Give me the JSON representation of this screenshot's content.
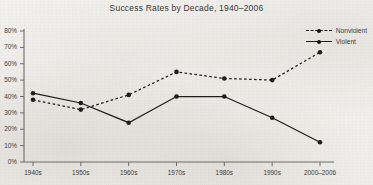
{
  "chart_data": {
    "type": "line",
    "title": "Success Rates by Decade, 1940–2006",
    "xlabel": "",
    "ylabel": "",
    "categories": [
      "1940s",
      "1950s",
      "1960s",
      "1970s",
      "1980s",
      "1990s",
      "2000–2006"
    ],
    "ylim": [
      0,
      80
    ],
    "yticks": [
      0,
      10,
      20,
      30,
      40,
      50,
      60,
      70,
      80
    ],
    "ytick_labels": [
      "0%",
      "10%",
      "20%",
      "30%",
      "40%",
      "50%",
      "60%",
      "70%",
      "80%"
    ],
    "grid": false,
    "legend_position": "top-right",
    "series": [
      {
        "name": "Nonviolent",
        "style": "dashed",
        "marker": "circle",
        "color": "#1d1d1b",
        "values": [
          38,
          32,
          41,
          55,
          51,
          50,
          67
        ]
      },
      {
        "name": "Violent",
        "style": "solid",
        "marker": "circle",
        "color": "#1d1d1b",
        "values": [
          42,
          36,
          24,
          40,
          40,
          27,
          12
        ]
      }
    ]
  },
  "legend": {
    "items": [
      {
        "label": "Nonviolent",
        "style": "dashed"
      },
      {
        "label": "Violent",
        "style": "solid"
      }
    ]
  }
}
